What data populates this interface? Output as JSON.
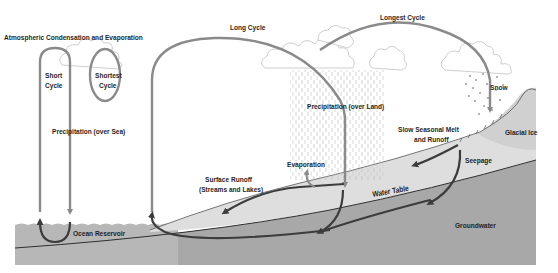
{
  "diagram": {
    "labels": {
      "atmospheric": "Atmospheric Condensation and Evaporation",
      "short_cycle_1": "Short",
      "short_cycle_2": "Cycle",
      "shortest_cycle_1": "Shortest",
      "shortest_cycle_2": "Cycle",
      "precip_sea": "Precipitation (over Sea)",
      "long_cycle": "Long Cycle",
      "longest_cycle": "Longest Cycle",
      "precip_land": "Precipitation (over Land)",
      "snow": "Snow",
      "glacial_ice": "Glacial Ice",
      "slow_melt_1": "Slow Seasonal Melt",
      "slow_melt_2": "and Runoff",
      "seepage": "Seepage",
      "evaporation": "Evaporation",
      "surface_runoff_1": "Surface Runoff",
      "surface_runoff_2": "(Streams and Lakes)",
      "water_table": "Water Table",
      "groundwater": "Groundwater",
      "ocean_reservoir": "Ocean Reservoir"
    },
    "colors": {
      "arrow_light": "#8a8a8a",
      "arrow_dark": "#3c3c3c",
      "ground_light": "#dcdcdc",
      "ground_dark": "#a6a6a6",
      "ocean": "#b4b4b4",
      "cloud_stroke": "#c8c8c8"
    }
  }
}
